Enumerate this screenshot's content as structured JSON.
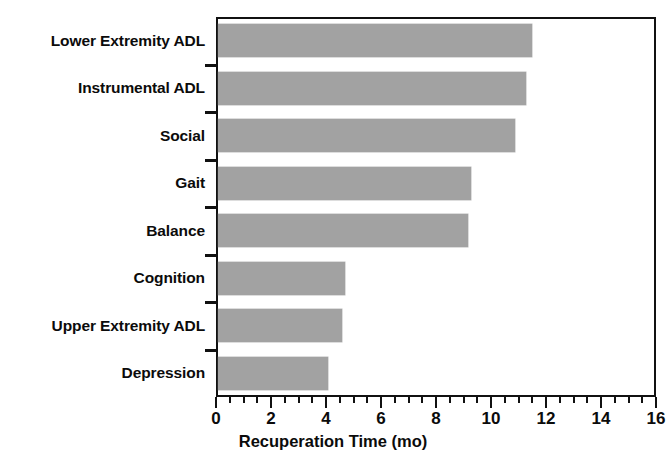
{
  "chart_data": {
    "type": "bar",
    "orientation": "horizontal",
    "title": "",
    "xlabel": "Recuperation Time (mo)",
    "ylabel": "",
    "xlim": [
      0,
      16
    ],
    "xticks": [
      0,
      2,
      4,
      6,
      8,
      10,
      12,
      14,
      16
    ],
    "xtick_labels": [
      "0",
      "2",
      "4",
      "6",
      "8",
      "10",
      "12",
      "14",
      "16"
    ],
    "minor_tick_interval": 0.5,
    "grid": false,
    "legend": false,
    "bar_color": "#a2a2a2",
    "frame_color": "#111111",
    "categories": [
      "Lower Extremity ADL",
      "Instrumental ADL",
      "Social",
      "Gait",
      "Balance",
      "Cognition",
      "Upper Extremity ADL",
      "Depression"
    ],
    "values": [
      11.4,
      11.2,
      10.8,
      9.2,
      9.1,
      4.6,
      4.5,
      4.0
    ],
    "units": "mo"
  }
}
